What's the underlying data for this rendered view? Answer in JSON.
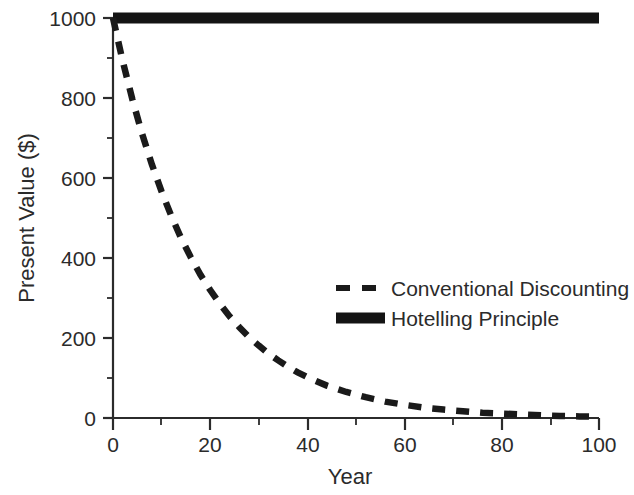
{
  "chart_data": {
    "type": "line",
    "title": "",
    "xlabel": "Year",
    "ylabel": "Present Value ($)",
    "xlim": [
      0,
      100
    ],
    "ylim": [
      0,
      1000
    ],
    "xticks": [
      0,
      20,
      40,
      60,
      80,
      100
    ],
    "xtick_labels": [
      "0",
      "20",
      "40",
      "60",
      "80",
      "100"
    ],
    "xminor_interval": 10,
    "yticks": [
      0,
      200,
      400,
      600,
      800,
      1000
    ],
    "ytick_labels": [
      "0",
      "200",
      "400",
      "600",
      "800",
      "1000"
    ],
    "yminor_interval": 100,
    "grid": false,
    "legend_position": "center-right",
    "series": [
      {
        "name": "Conventional Discounting",
        "style": "dashed",
        "color": "#1a1a1a",
        "x": [
          0,
          2,
          4,
          6,
          8,
          10,
          12,
          14,
          16,
          18,
          20,
          22,
          24,
          26,
          28,
          30,
          32,
          34,
          36,
          38,
          40,
          44,
          48,
          52,
          56,
          60,
          64,
          68,
          72,
          76,
          80,
          84,
          88,
          92,
          96,
          100
        ],
        "values": [
          1000,
          892,
          796,
          710,
          634,
          566,
          505,
          450,
          402,
          358,
          320,
          285,
          254,
          227,
          202,
          181,
          161,
          144,
          128,
          114,
          102,
          81,
          65,
          52,
          41,
          33,
          26,
          21,
          17,
          13,
          11,
          9,
          7,
          5,
          4,
          3
        ]
      },
      {
        "name": "Hotelling Principle",
        "style": "solid",
        "color": "#141414",
        "x": [
          0,
          100
        ],
        "values": [
          1000,
          1000
        ]
      }
    ],
    "annotations": []
  },
  "legend": {
    "entries": [
      {
        "label": "Conventional Discounting",
        "marker": "dashed-line-swatch"
      },
      {
        "label": "Hotelling Principle",
        "marker": "solid-line-swatch"
      }
    ]
  },
  "axes": {
    "x_title": "Year",
    "y_title": "Present Value ($)"
  }
}
